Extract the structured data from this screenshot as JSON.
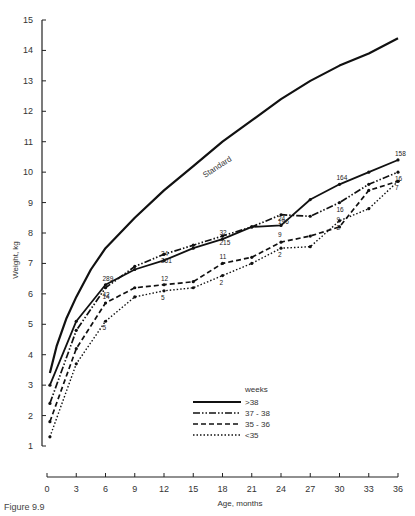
{
  "chart_data": {
    "type": "line",
    "title": "",
    "xlabel": "Age, months",
    "ylabel": "Weight, kg",
    "xlim": [
      0,
      36
    ],
    "ylim": [
      1,
      15
    ],
    "x_ticks": [
      0,
      3,
      6,
      9,
      12,
      15,
      18,
      21,
      24,
      27,
      30,
      33,
      36
    ],
    "y_ticks": [
      1,
      2,
      3,
      4,
      5,
      6,
      7,
      8,
      9,
      10,
      11,
      12,
      13,
      14,
      15
    ],
    "grid": false,
    "legend": {
      "title": "weeks",
      "position": "lower center"
    },
    "series": [
      {
        "name": "Standard",
        "style": "solid-thick",
        "x": [
          0.3,
          1,
          2,
          3,
          4.5,
          6,
          9,
          12,
          15,
          18,
          21,
          24,
          27,
          30,
          33,
          36
        ],
        "y": [
          3.4,
          4.3,
          5.2,
          5.9,
          6.8,
          7.5,
          8.5,
          9.4,
          10.2,
          11.0,
          11.7,
          12.4,
          13.0,
          13.5,
          13.9,
          14.4
        ]
      },
      {
        "name": "> 38",
        "style": "solid",
        "x": [
          0.3,
          3,
          6,
          9,
          12,
          15,
          18,
          21,
          24,
          27,
          30,
          33,
          36
        ],
        "y": [
          3.0,
          5.1,
          6.3,
          6.8,
          7.1,
          7.5,
          7.8,
          8.2,
          8.25,
          9.1,
          9.6,
          10.0,
          10.4
        ],
        "labels": {
          "0": "32",
          "6": "289",
          "12": "34",
          "18": "32",
          "24": "24",
          "30": "164",
          "36": "158"
        }
      },
      {
        "name": "37 - 38",
        "style": "dash-dot",
        "x": [
          0.3,
          3,
          6,
          9,
          12,
          15,
          18,
          21,
          24,
          27,
          30,
          33,
          36
        ],
        "y": [
          2.4,
          4.8,
          6.2,
          6.9,
          7.3,
          7.6,
          7.9,
          8.2,
          8.6,
          8.55,
          9.0,
          9.6,
          10.0
        ],
        "labels": {
          "0": "45",
          "6": "42",
          "12": "261",
          "18": "215",
          "24": "196",
          "30": "16",
          "36": "16"
        }
      },
      {
        "name": "35 - 36",
        "style": "dashed",
        "x": [
          0.3,
          3,
          6,
          9,
          12,
          15,
          18,
          21,
          24,
          27,
          30,
          33,
          36
        ],
        "y": [
          1.8,
          4.2,
          5.7,
          6.2,
          6.3,
          6.4,
          7.0,
          7.2,
          7.7,
          7.9,
          8.2,
          9.4,
          9.7
        ],
        "labels": {
          "0": "16",
          "6": "14",
          "12": "12",
          "18": "11",
          "24": "9",
          "30": "9"
        }
      },
      {
        "name": "< 35",
        "style": "dotted",
        "x": [
          0.3,
          3,
          6,
          9,
          12,
          15,
          18,
          21,
          24,
          27,
          30,
          33,
          36
        ],
        "y": [
          1.3,
          3.7,
          5.1,
          5.9,
          6.1,
          6.2,
          6.6,
          7.0,
          7.5,
          7.55,
          8.4,
          8.8,
          9.7
        ],
        "labels": {
          "0": "7",
          "6": "5",
          "12": "5",
          "18": "2",
          "24": "2",
          "30": "2",
          "36": "7"
        }
      }
    ],
    "annotations": [
      "Standard"
    ]
  },
  "legend": {
    "title": "weeks",
    "items": [
      ">38",
      "37 - 38",
      "35 - 36",
      "<35"
    ]
  },
  "caption": "Figure 9.9"
}
